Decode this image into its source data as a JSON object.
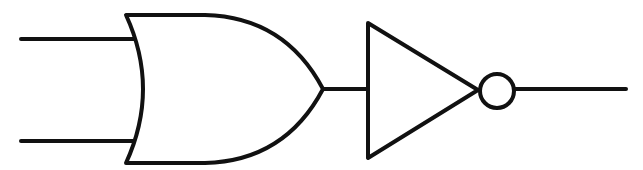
{
  "diagram": {
    "type": "logic-gate-circuit",
    "description": "Two-input OR gate followed by a NOT gate (inverter), forming a NOR function",
    "components": [
      {
        "id": "or-gate",
        "kind": "OR",
        "inputs": 2
      },
      {
        "id": "not-gate",
        "kind": "NOT",
        "inputs": 1,
        "has_inversion_bubble": true
      }
    ],
    "connections": [
      {
        "from": "input-a",
        "to": "or-gate"
      },
      {
        "from": "input-b",
        "to": "or-gate"
      },
      {
        "from": "or-gate",
        "to": "not-gate"
      },
      {
        "from": "not-gate",
        "to": "output"
      }
    ],
    "colors": {
      "stroke": "#111111",
      "background": "#ffffff"
    }
  }
}
